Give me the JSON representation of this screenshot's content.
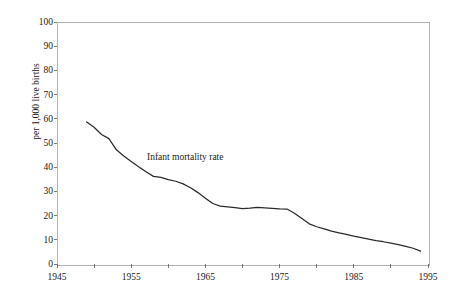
{
  "chart_data": {
    "type": "line",
    "title": "",
    "subtitle": "",
    "xlabel": "",
    "ylabel": "per 1,000 live births",
    "xlim": [
      1945,
      1995
    ],
    "ylim": [
      0,
      100
    ],
    "grid": false,
    "legend_position": "inline-annotation",
    "xticks": [
      1945,
      1955,
      1965,
      1975,
      1985,
      1995
    ],
    "xtick_labels": [
      "1945",
      "1955",
      "1965",
      "1975",
      "1985",
      "1995"
    ],
    "yticks": [
      0,
      10,
      20,
      30,
      40,
      50,
      60,
      70,
      80,
      90,
      100
    ],
    "ytick_labels": [
      "0",
      "10",
      "20",
      "30",
      "40",
      "50",
      "60",
      "70",
      "80",
      "90",
      "100"
    ],
    "annotations": [
      {
        "name": "series-label",
        "text": "Infant mortality rate",
        "x": 1964,
        "y": 44
      }
    ],
    "series": [
      {
        "name": "Infant mortality rate",
        "color": "#2b2b2b",
        "x": [
          1949,
          1950,
          1951,
          1952,
          1953,
          1954,
          1955,
          1956,
          1957,
          1958,
          1959,
          1960,
          1961,
          1962,
          1963,
          1964,
          1965,
          1966,
          1967,
          1968,
          1969,
          1970,
          1971,
          1972,
          1973,
          1974,
          1975,
          1976,
          1977,
          1978,
          1979,
          1980,
          1981,
          1982,
          1983,
          1984,
          1985,
          1986,
          1987,
          1988,
          1989,
          1990,
          1991,
          1992,
          1993,
          1994
        ],
        "y": [
          58.7,
          56.5,
          53.5,
          51.8,
          47.2,
          44.6,
          42.4,
          40.2,
          38.1,
          36.2,
          35.8,
          34.9,
          34.2,
          33.1,
          31.5,
          29.5,
          27.2,
          25.0,
          23.9,
          23.6,
          23.3,
          22.9,
          23.1,
          23.4,
          23.2,
          23.0,
          22.8,
          22.7,
          21.0,
          18.8,
          16.6,
          15.4,
          14.5,
          13.6,
          12.9,
          12.2,
          11.5,
          10.9,
          10.3,
          9.7,
          9.2,
          8.6,
          8.0,
          7.3,
          6.5,
          5.3
        ]
      }
    ]
  },
  "axes": {
    "y_axis_title": "per 1,000 live births"
  }
}
